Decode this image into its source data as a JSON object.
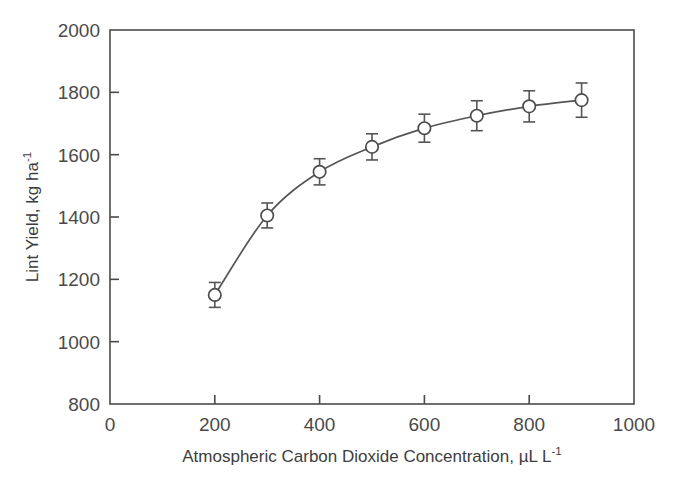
{
  "chart_data": {
    "type": "line",
    "title": "",
    "subtitle": "",
    "xlabel": "Atmospheric Carbon Dioxide Concentration, µL L",
    "xlabel_exponent": "-1",
    "ylabel": "Lint Yield, kg ha",
    "ylabel_exponent": "-1",
    "xlim": [
      0,
      1000
    ],
    "ylim": [
      800,
      2000
    ],
    "xticks": [
      0,
      200,
      400,
      600,
      800,
      1000
    ],
    "yticks": [
      800,
      1000,
      1200,
      1400,
      1600,
      1800,
      2000
    ],
    "xtick_labels": [
      "0",
      "200",
      "400",
      "600",
      "800",
      "1000"
    ],
    "ytick_labels": [
      "800",
      "1000",
      "1200",
      "1400",
      "1600",
      "1800",
      "2000"
    ],
    "grid": false,
    "legend": false,
    "legend_position": "none",
    "marker": "open-circle",
    "error_bars": true,
    "line_color": "#555555",
    "marker_face_color": "#ffffff",
    "marker_edge_color": "#4d4d4d",
    "axis_color": "#4a4a4a",
    "x": [
      200,
      300,
      400,
      500,
      600,
      700,
      800,
      900
    ],
    "values": [
      1150,
      1405,
      1545,
      1625,
      1685,
      1725,
      1755,
      1775
    ],
    "yerr": [
      40,
      40,
      42,
      42,
      45,
      48,
      50,
      55
    ],
    "series": [
      {
        "name": "Lint Yield",
        "x": [
          200,
          300,
          400,
          500,
          600,
          700,
          800,
          900
        ],
        "values": [
          1150,
          1405,
          1545,
          1625,
          1685,
          1725,
          1755,
          1775
        ],
        "yerr": [
          40,
          40,
          42,
          42,
          45,
          48,
          50,
          55
        ]
      }
    ],
    "annotations": []
  }
}
